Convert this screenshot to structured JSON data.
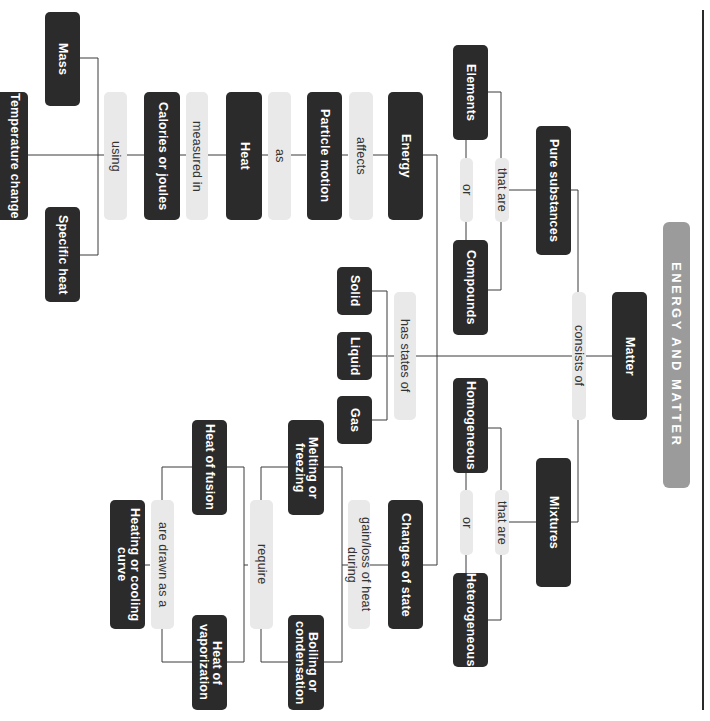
{
  "title": "ENERGY AND MATTER",
  "colors": {
    "concept_box": "#2b2b2b",
    "concept_text": "#ffffff",
    "linking_box": "#e9e9e9",
    "linking_text": "#333333",
    "title_bar": "#9b9b9b",
    "connector": "#3a3a3a"
  },
  "concepts": {
    "matter": "Matter",
    "pure_substances": "Pure substances",
    "mixtures": "Mixtures",
    "elements": "Elements",
    "compounds": "Compounds",
    "homogeneous": "Homogeneous",
    "heterogeneous": "Heterogeneous",
    "energy": "Energy",
    "particle_motion": "Particle motion",
    "heat": "Heat",
    "calories_or_joules": "Calories or joules",
    "mass": "Mass",
    "specific_heat": "Specific heat",
    "temperature_change": "Temperature change",
    "solid": "Solid",
    "liquid": "Liquid",
    "gas": "Gas",
    "changes_of_state": "Changes of state",
    "melting_or_freezing": "Melting or freezing",
    "boiling_or_condensation": "Boiling or condensation",
    "heat_of_fusion": "Heat of fusion",
    "heat_of_vaporization": "Heat of vaporization",
    "heating_or_cooling_curve": "Heating or cooling curve"
  },
  "links": {
    "consists_of": "consists of",
    "that_are_pure": "that are",
    "that_are_mix": "that are",
    "or_pure": "or",
    "or_mix": "or",
    "affects": "affects",
    "as": "as",
    "measured_in": "measured in",
    "using": "using",
    "has_states_of": "has states of",
    "gain_loss_heat": "gain/loss of heat during",
    "require": "require",
    "are_drawn_as_a": "are drawn as a"
  }
}
